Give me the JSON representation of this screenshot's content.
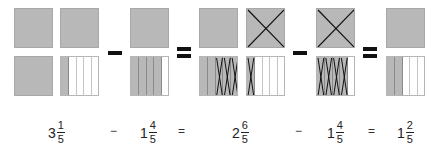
{
  "diagram": {
    "title": "",
    "colors": {
      "fill": "#b8b8b8",
      "empty": "#ffffff",
      "line": "#111111"
    },
    "groups": [
      {
        "id": "g1",
        "squares": [
          {
            "x": 14,
            "y": 8,
            "type": "full",
            "crossed": false
          },
          {
            "x": 60,
            "y": 8,
            "type": "full",
            "crossed": false
          },
          {
            "x": 14,
            "y": 56,
            "type": "full",
            "crossed": false
          },
          {
            "x": 60,
            "y": 56,
            "type": "strips",
            "filled": 1,
            "crossed_strips": 0
          }
        ]
      },
      {
        "id": "g2",
        "squares": [
          {
            "x": 130,
            "y": 8,
            "type": "full",
            "crossed": false
          },
          {
            "x": 130,
            "y": 56,
            "type": "strips",
            "filled": 4,
            "crossed_strips": 0
          }
        ]
      },
      {
        "id": "g3",
        "squares": [
          {
            "x": 199,
            "y": 8,
            "type": "full",
            "crossed": false
          },
          {
            "x": 246,
            "y": 8,
            "type": "full",
            "crossed": true
          },
          {
            "x": 199,
            "y": 56,
            "type": "strips",
            "filled": 5,
            "crossed_strips": 3,
            "cross_start": 2
          },
          {
            "x": 246,
            "y": 56,
            "type": "strips",
            "filled": 1,
            "crossed_strips": 1,
            "cross_start": 0
          }
        ]
      },
      {
        "id": "g4",
        "squares": [
          {
            "x": 316,
            "y": 8,
            "type": "full",
            "crossed": true
          },
          {
            "x": 316,
            "y": 56,
            "type": "strips",
            "filled": 4,
            "crossed_strips": 4,
            "cross_start": 0
          }
        ]
      },
      {
        "id": "g5",
        "squares": [
          {
            "x": 386,
            "y": 8,
            "type": "full",
            "crossed": false
          },
          {
            "x": 386,
            "y": 56,
            "type": "strips",
            "filled": 2,
            "crossed_strips": 0
          }
        ]
      }
    ],
    "operators": [
      {
        "kind": "minus",
        "x": 108,
        "y": 51,
        "w": 14
      },
      {
        "kind": "equals",
        "x": 177,
        "y": 47,
        "w": 14
      },
      {
        "kind": "minus",
        "x": 293,
        "y": 51,
        "w": 14
      },
      {
        "kind": "equals",
        "x": 363,
        "y": 47,
        "w": 14
      }
    ]
  },
  "equation": {
    "terms": [
      {
        "whole": "3",
        "num": "1",
        "den": "5",
        "x": 48
      },
      {
        "whole": "1",
        "num": "4",
        "den": "5",
        "x": 140
      },
      {
        "whole": "2",
        "num": "6",
        "den": "5",
        "x": 232
      },
      {
        "whole": "1",
        "num": "4",
        "den": "5",
        "x": 327
      },
      {
        "whole": "1",
        "num": "2",
        "den": "5",
        "x": 397
      }
    ],
    "operators": [
      {
        "symbol": "−",
        "x": 110
      },
      {
        "symbol": "=",
        "x": 178
      },
      {
        "symbol": "−",
        "x": 295
      },
      {
        "symbol": "=",
        "x": 368
      }
    ]
  }
}
